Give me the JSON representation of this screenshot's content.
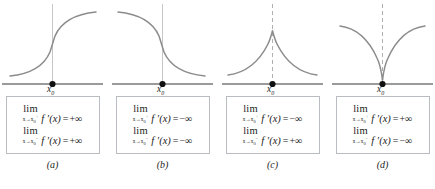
{
  "figure": {
    "type": "math-figure",
    "axis_color": "#9a9a9a",
    "curve_color": "#8c8c8c",
    "box_border_color": "#b9bcc0",
    "point_color": "#111111",
    "text_color": "#1b1b1b"
  },
  "symbols": {
    "lim": "lim",
    "fprime": "f ′(x)",
    "equals": "=",
    "plus_infinity": "+∞",
    "minus_infinity": "−∞",
    "arrow": "→",
    "x_var": "x",
    "x0": "x",
    "zero": "0",
    "plus_sup": "+",
    "minus_sup": "−",
    "x0_axis_label": "x",
    "x0_axis_sub": "0"
  },
  "panels": [
    {
      "id": "a",
      "label": "(a)",
      "curve_kind": "increasing-vertical-tangent",
      "vertical_line_style": "solid",
      "limits": [
        {
          "side": "right",
          "lim": "lim",
          "sub_x": "x",
          "sub_arrow": "→",
          "sub_x0": "x",
          "sub_zero": "0",
          "sub_sign": "+",
          "fn": "f ′(x)",
          "equals": "=",
          "value": "+∞"
        },
        {
          "side": "left",
          "lim": "lim",
          "sub_x": "x",
          "sub_arrow": "→",
          "sub_x0": "x",
          "sub_zero": "0",
          "sub_sign": "−",
          "fn": "f ′(x)",
          "equals": "=",
          "value": "+∞"
        }
      ]
    },
    {
      "id": "b",
      "label": "(b)",
      "curve_kind": "decreasing-vertical-tangent",
      "vertical_line_style": "solid",
      "limits": [
        {
          "side": "right",
          "lim": "lim",
          "sub_x": "x",
          "sub_arrow": "→",
          "sub_x0": "x",
          "sub_zero": "0",
          "sub_sign": "+",
          "fn": "f ′(x)",
          "equals": "=",
          "value": "−∞"
        },
        {
          "side": "left",
          "lim": "lim",
          "sub_x": "x",
          "sub_arrow": "→",
          "sub_x0": "x",
          "sub_zero": "0",
          "sub_sign": "−",
          "fn": "f ′(x)",
          "equals": "=",
          "value": "−∞"
        }
      ]
    },
    {
      "id": "c",
      "label": "(c)",
      "curve_kind": "upward-cusp",
      "vertical_line_style": "dashed",
      "limits": [
        {
          "side": "right",
          "lim": "lim",
          "sub_x": "x",
          "sub_arrow": "→",
          "sub_x0": "x",
          "sub_zero": "0",
          "sub_sign": "+",
          "fn": "f ′(x)",
          "equals": "=",
          "value": "−∞"
        },
        {
          "side": "left",
          "lim": "lim",
          "sub_x": "x",
          "sub_arrow": "→",
          "sub_x0": "x",
          "sub_zero": "0",
          "sub_sign": "−",
          "fn": "f ′(x)",
          "equals": "=",
          "value": "+∞"
        }
      ]
    },
    {
      "id": "d",
      "label": "(d)",
      "curve_kind": "downward-cusp",
      "vertical_line_style": "dashed",
      "limits": [
        {
          "side": "right",
          "lim": "lim",
          "sub_x": "x",
          "sub_arrow": "→",
          "sub_x0": "x",
          "sub_zero": "0",
          "sub_sign": "+",
          "fn": "f ′(x)",
          "equals": "=",
          "value": "+∞"
        },
        {
          "side": "left",
          "lim": "lim",
          "sub_x": "x",
          "sub_arrow": "→",
          "sub_x0": "x",
          "sub_zero": "0",
          "sub_sign": "−",
          "fn": "f ′(x)",
          "equals": "=",
          "value": "−∞"
        }
      ]
    }
  ]
}
